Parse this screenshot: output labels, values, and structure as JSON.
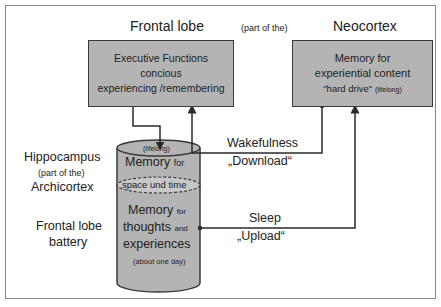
{
  "labels": {
    "frontal_lobe_title": "Frontal lobe",
    "part_of_the_top": "(part of the)",
    "neocortex_title": "Neocortex",
    "hippocampus": "Hippocampus",
    "part_of_the_left": "(part of the)",
    "archicortex": "Archicortex",
    "frontal_lobe_battery_line1": "Frontal lobe",
    "frontal_lobe_battery_line2": "battery",
    "wakefulness": "Wakefulness",
    "download": "„Download“",
    "sleep": "Sleep",
    "upload": "„Upload“"
  },
  "frontal_box": {
    "line1": "Executive Functions",
    "line2": "concious",
    "line3": "experiencing /remembering"
  },
  "neocortex_box": {
    "line1": "Memory for",
    "line2": "experiential  content",
    "line3_main": "\"hard drive\"",
    "line3_small": "(lifelong)"
  },
  "cylinder": {
    "top_small": "(lifelong)",
    "top_main": "Memory",
    "top_for": "for",
    "ellipse_text": "space und time",
    "mid_main": "Memory",
    "mid_for": "for",
    "thoughts": "thoughts",
    "and": "and",
    "experiences": "experiences",
    "bottom_small": "(about one day)"
  },
  "colors": {
    "box_fill": "#b4b4b4",
    "cylinder_fill": "#b4b4b4",
    "ellipse_fill": "#c8c8c8",
    "line": "#2a2a2a",
    "frame": "#8a8a8a"
  }
}
